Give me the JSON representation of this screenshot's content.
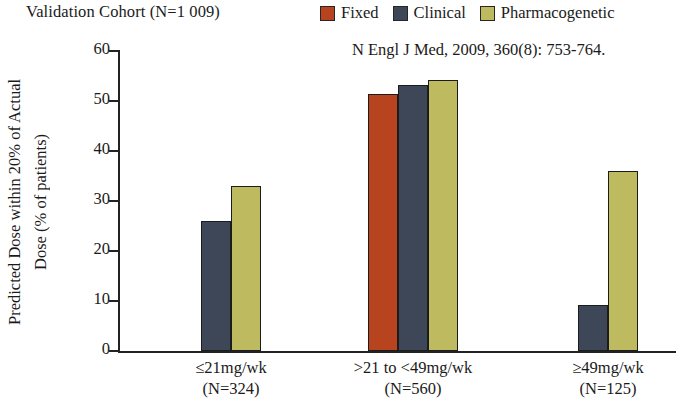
{
  "chart_data": {
    "type": "bar",
    "title": "Validation Cohort (N=1 009)",
    "citation": "N Engl J Med, 2009, 360(8): 753-764.",
    "xlabel": "",
    "ylabel_line1": "Predicted Dose within 20% of Actual",
    "ylabel_line2": "Dose (% of patients)",
    "ylim": [
      0,
      60
    ],
    "ytick_labels": [
      "0",
      "10",
      "20",
      "30",
      "40",
      "50",
      "60"
    ],
    "yticks": [
      0,
      10,
      20,
      30,
      40,
      50,
      60
    ],
    "grid": false,
    "legend_position": "top-right",
    "categories": [
      "≤21mg/wk",
      ">21 to <49mg/wk",
      "≥49mg/wk"
    ],
    "category_sublabels": [
      "(N=324)",
      "(N=560)",
      "(N=125)"
    ],
    "series": [
      {
        "name": "Fixed",
        "color": "#B8431F",
        "values": [
          null,
          51.5,
          null
        ]
      },
      {
        "name": "Clinical",
        "color": "#3E4757",
        "values": [
          26.0,
          53.3,
          9.3
        ]
      },
      {
        "name": "Pharmacogenetic",
        "color": "#BDBA60",
        "values": [
          33.0,
          54.3,
          36.0
        ]
      }
    ]
  },
  "legend": {
    "items": [
      {
        "label": "Fixed",
        "color": "#B8431F"
      },
      {
        "label": "Clinical",
        "color": "#3E4757"
      },
      {
        "label": "Pharmacogenetic",
        "color": "#BDBA60"
      }
    ]
  },
  "colors": {
    "axis": "#222222",
    "background": "#FFFFFF",
    "bar_outline": "#1C1C1C",
    "fixed": "#B8431F",
    "clinical": "#3E4757",
    "pharmacogenetic": "#BDBA60"
  }
}
